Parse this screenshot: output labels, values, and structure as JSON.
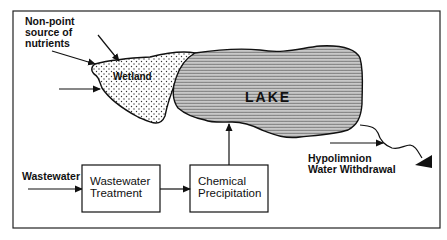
{
  "diagram": {
    "labels": {
      "nonpoint": [
        "Non-point",
        "source of",
        "nutrients"
      ],
      "wetland": "Wetland",
      "lake": "LAKE",
      "wastewater_input": "Wastewater",
      "hypolimnion": [
        "Hypolimnion",
        "Water Withdrawal"
      ]
    },
    "boxes": {
      "wastewater_treatment": [
        "Wastewater",
        "Treatment"
      ],
      "chemical_precipitation": [
        "Chemical",
        "Precipitation"
      ]
    },
    "flows": [
      {
        "from": "Non-point source of nutrients",
        "to": "Wetland"
      },
      {
        "from": "Inflow",
        "to": "Wetland"
      },
      {
        "from": "Wastewater",
        "to": "Wastewater Treatment"
      },
      {
        "from": "Wastewater Treatment",
        "to": "Chemical Precipitation"
      },
      {
        "from": "Chemical Precipitation",
        "to": "LAKE"
      },
      {
        "from": "LAKE",
        "to": "Hypolimnion Water Withdrawal"
      }
    ],
    "colors": {
      "line": "#111111",
      "background": "#ffffff"
    }
  }
}
